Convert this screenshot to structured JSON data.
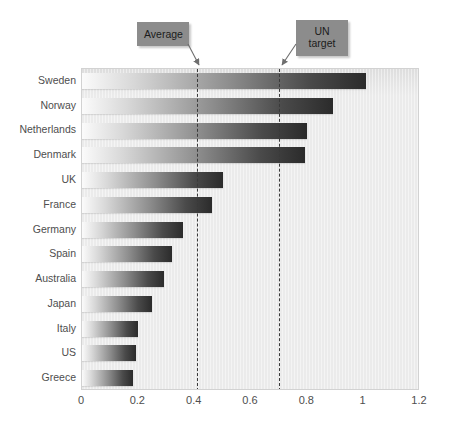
{
  "chart_data": {
    "type": "bar",
    "orientation": "horizontal",
    "title": "",
    "xlabel": "",
    "ylabel": "",
    "categories": [
      "Sweden",
      "Norway",
      "Netherlands",
      "Denmark",
      "UK",
      "France",
      "Germany",
      "Spain",
      "Australia",
      "Japan",
      "Italy",
      "US",
      "Greece"
    ],
    "values": [
      1.01,
      0.89,
      0.8,
      0.79,
      0.5,
      0.46,
      0.36,
      0.32,
      0.29,
      0.25,
      0.2,
      0.19,
      0.18
    ],
    "xlim": [
      0,
      1.2
    ],
    "xticks": [
      0,
      0.2,
      0.4,
      0.6,
      0.8,
      1,
      1.2
    ],
    "xticklabels": [
      "0",
      "0.2",
      "0.4",
      "0.6",
      "0.8",
      "1",
      "1.2"
    ],
    "grid": false,
    "legend": "none",
    "reference_lines": [
      {
        "id": "average",
        "label": "Average",
        "label_line2": "",
        "value": 0.41
      },
      {
        "id": "un-target",
        "label": "UN",
        "label_line2": "target",
        "value": 0.7
      }
    ],
    "bar_fill": "gradient-light-to-dark",
    "plot_background": "#ebebeb",
    "colors": {
      "plot_bg": "#ebebeb",
      "bar_dark": "#2b2b2b",
      "bar_light": "#fbfbfb",
      "callout_bg": "#8c8c8c",
      "text": "#4e4e4e",
      "ref_line": "#3a3a3a"
    }
  }
}
